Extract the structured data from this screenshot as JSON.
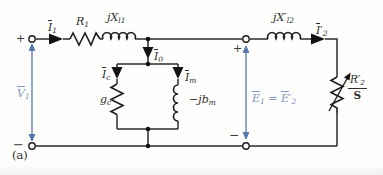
{
  "figure": {
    "caption": "(a)",
    "colors": {
      "wire": "#2d2d2d",
      "blue_line": "#5878ae",
      "blue_text": "#8395c0",
      "text": "#2f2f2f",
      "background": "#fdfdfb"
    }
  },
  "labels": {
    "i1": {
      "base": "I",
      "sub": "1"
    },
    "r1": {
      "base": "R",
      "sub": "1"
    },
    "jxl1": {
      "base": "jX",
      "sub": "l1"
    },
    "i0": {
      "base": "I",
      "sub": "0"
    },
    "ic": {
      "base": "I",
      "sub": "c"
    },
    "im": {
      "base": "I",
      "sub": "m"
    },
    "gc": {
      "base": "g",
      "sub": "c"
    },
    "jbm": {
      "base": "−jb",
      "sub": "m"
    },
    "jxl2": {
      "base": "jX",
      "prime": "′",
      "sub": "l2"
    },
    "i2": {
      "base": "I",
      "prime": "′",
      "sub": "2"
    },
    "v1": {
      "base": "V",
      "sub": "1"
    },
    "e1": {
      "base": "E",
      "sub": "1"
    },
    "equals": "=",
    "e2": {
      "base": "E",
      "prime": "′",
      "sub": "2"
    },
    "r2": {
      "base": "R",
      "prime": "′",
      "sub": "2"
    },
    "slip": "S",
    "plus_left": "+",
    "minus_left": "−",
    "plus_mid": "+",
    "minus_mid": "−"
  }
}
